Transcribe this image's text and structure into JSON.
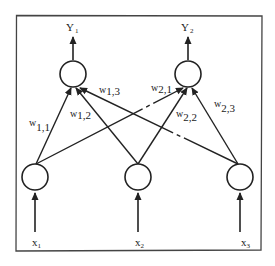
{
  "diagram": {
    "type": "neural-network",
    "outputs": [
      {
        "id": "y1",
        "label": "Y",
        "sub": "1"
      },
      {
        "id": "y2",
        "label": "Y",
        "sub": "2"
      }
    ],
    "inputs": [
      {
        "id": "x1",
        "label": "x",
        "sub": "1"
      },
      {
        "id": "x2",
        "label": "x",
        "sub": "2"
      },
      {
        "id": "x3",
        "label": "x",
        "sub": "3"
      }
    ],
    "weights": [
      {
        "id": "w11",
        "label": "w",
        "sub": "1,1",
        "from": "x1",
        "to": "y1"
      },
      {
        "id": "w12",
        "label": "w",
        "sub": "1,2",
        "from": "x2",
        "to": "y1"
      },
      {
        "id": "w13",
        "label": "w",
        "sub": "1,3",
        "from": "x3",
        "to": "y1"
      },
      {
        "id": "w21",
        "label": "w",
        "sub": "2,1",
        "from": "x1",
        "to": "y2"
      },
      {
        "id": "w22",
        "label": "w",
        "sub": "2,2",
        "from": "x2",
        "to": "y2"
      },
      {
        "id": "w23",
        "label": "w",
        "sub": "2,3",
        "from": "x3",
        "to": "y2"
      }
    ]
  }
}
